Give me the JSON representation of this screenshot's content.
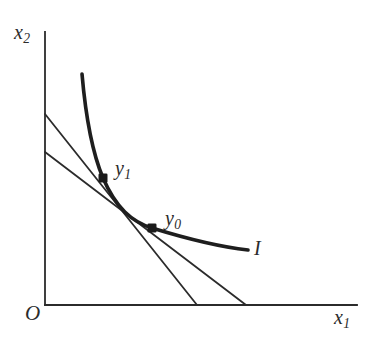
{
  "figure": {
    "background_color": "#ffffff",
    "ink_color": "#2b2b2b",
    "axes": {
      "origin_label": "O",
      "x_axis_label_base": "x",
      "x_axis_label_sub": "1",
      "y_axis_label_base": "x",
      "y_axis_label_sub": "2",
      "x_axis": {
        "x1": 45,
        "y1": 305,
        "x2": 357,
        "y2": 305,
        "width": 1.8
      },
      "y_axis": {
        "x1": 45,
        "y1": 32,
        "x2": 45,
        "y2": 305,
        "width": 1.8
      }
    },
    "curve": {
      "name": "indifference-curve",
      "label": "I",
      "stroke_width": 3.6,
      "path": "M 82,74 C 86,120 92,152 103,178 C 116,208 132,222 152,228 C 178,236 212,246 248,250"
    },
    "budget_lines": [
      {
        "name": "budget-line-steep",
        "stroke_width": 1.8,
        "x1": 45,
        "y1": 114,
        "x2": 197,
        "y2": 305,
        "tangent_point": "y1"
      },
      {
        "name": "budget-line-flat",
        "stroke_width": 1.8,
        "x1": 45,
        "y1": 152,
        "x2": 246,
        "y2": 305,
        "tangent_point": "y0"
      }
    ],
    "points": [
      {
        "name": "point-y1",
        "label_base": "y",
        "label_sub": "1",
        "x": 103,
        "y": 178,
        "marker": "filled-square",
        "size": 8
      },
      {
        "name": "point-y0",
        "label_base": "y",
        "label_sub": "0",
        "x": 152,
        "y": 228,
        "marker": "filled-square",
        "size": 8
      }
    ]
  }
}
